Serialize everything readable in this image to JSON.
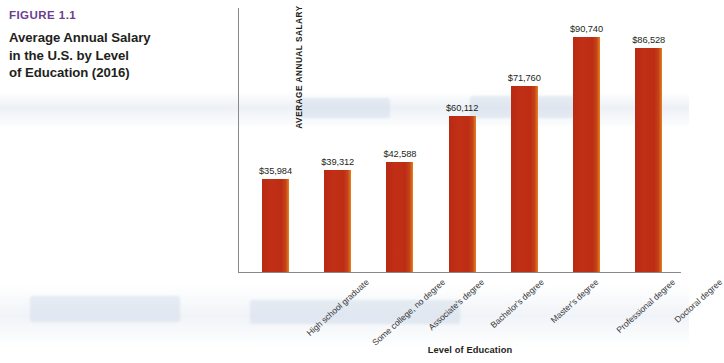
{
  "caption": {
    "figure_number": "FIGURE 1.1",
    "title": "Average Annual Salary in the U.S. by Level of Education (2016)",
    "title_line1": "Average Annual Salary",
    "title_line2": "in the U.S. by Level",
    "title_line3": "of Education (2016)",
    "accent_color": "#6b3f8e"
  },
  "chart_data": {
    "type": "bar",
    "title": "Average Annual Salary in the U.S. by Level of Education (2016)",
    "xlabel": "Level of Education",
    "ylabel": "AVERAGE ANNUAL SALARY",
    "categories": [
      "High school graduate",
      "Some college, no degree",
      "Associate's degree",
      "Bachelor's degree",
      "Master's degree",
      "Professional degree",
      "Doctoral degree"
    ],
    "values": [
      35984,
      39312,
      42588,
      60112,
      71760,
      90740,
      86528
    ],
    "value_labels": [
      "$35,984",
      "$39,312",
      "$42,588",
      "$60,112",
      "$71,760",
      "$90,740",
      "$86,528"
    ],
    "ylim": [
      0,
      102000
    ],
    "grid": false,
    "legend": false,
    "bar_color": "#bf2e17",
    "bar_edge_highlight": "#e8821d",
    "axis_color": "#87898c"
  }
}
